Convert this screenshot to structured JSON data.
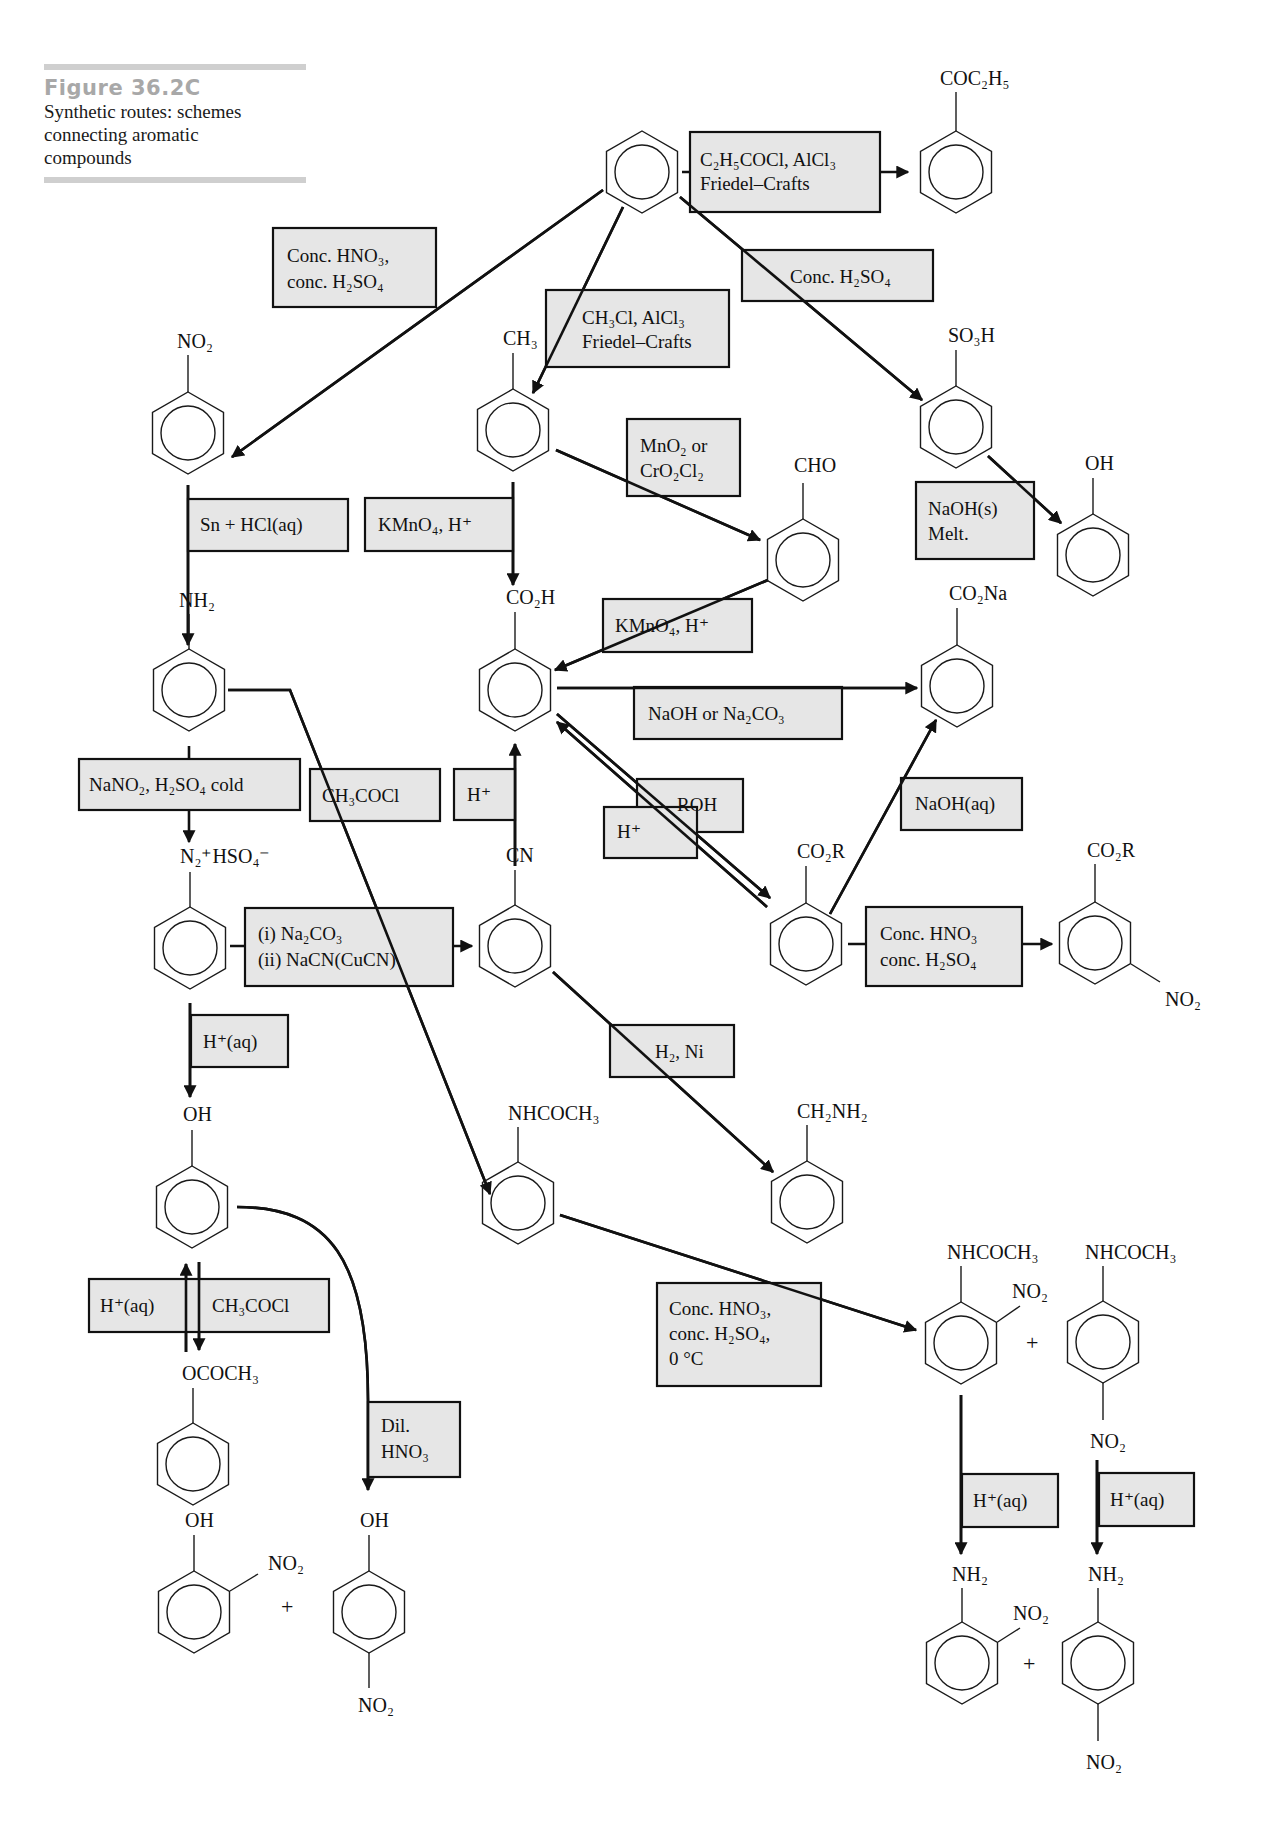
{
  "figure": {
    "number": "Figure 36.2C",
    "caption_lines": [
      "Synthetic routes: schemes",
      "connecting aromatic",
      "compounds"
    ]
  },
  "compounds": {
    "benzene": {
      "label": ""
    },
    "propiophenone": {
      "label": "COC₂H₅"
    },
    "nitrobenzene": {
      "label": "NO₂"
    },
    "toluene": {
      "label": "CH₃"
    },
    "benzenesulfonic_acid": {
      "label": "SO₃H"
    },
    "phenol_from_sulfonate": {
      "label": "OH"
    },
    "benzaldehyde": {
      "label": "CHO"
    },
    "phenylamine": {
      "label": "NH₂"
    },
    "benzoic_acid": {
      "label": "CO₂H"
    },
    "sodium_benzoate": {
      "label": "CO₂Na"
    },
    "diazonium_salt": {
      "label": "N₂⁺HSO₄⁻"
    },
    "benzonitrile": {
      "label": "CN"
    },
    "ester": {
      "label": "CO₂R"
    },
    "nitro_ester": {
      "label_top": "CO₂R",
      "label_meta": "NO₂"
    },
    "phenol": {
      "label": "OH"
    },
    "acetanilide": {
      "label": "NHCOCH₃"
    },
    "benzylamine": {
      "label": "CH₂NH₂"
    },
    "phenyl_ethanoate": {
      "label": "OCOCH₃"
    },
    "o_nitrophenol": {
      "label_top": "OH",
      "label_ortho": "NO₂"
    },
    "p_nitrophenol": {
      "label_top": "OH",
      "label_para": "NO₂"
    },
    "o_nitroacetanilide": {
      "label_top": "NHCOCH₃",
      "label_ortho": "NO₂"
    },
    "p_nitroacetanilide": {
      "label_top": "NHCOCH₃",
      "label_para": "NO₂"
    },
    "o_nitroaniline": {
      "label_top": "NH₂",
      "label_ortho": "NO₂"
    },
    "p_nitroaniline": {
      "label_top": "NH₂",
      "label_para": "NO₂"
    },
    "plus_sign": "+"
  },
  "reagents": {
    "friedel_crafts_acylation": [
      "C₂H₅COCl, AlCl₃",
      "Friedel–Crafts"
    ],
    "nitration": [
      "Conc. HNO₃,",
      "conc. H₂SO₄"
    ],
    "friedel_crafts_alkylation": [
      "CH₃Cl, AlCl₃",
      "Friedel–Crafts"
    ],
    "sulfonation": [
      "Conc. H₂SO₄"
    ],
    "oxidation_to_aldehyde": [
      "MnO₂ or",
      "CrO₂Cl₂"
    ],
    "alkali_fusion": [
      "NaOH(s)",
      "Melt."
    ],
    "reduction": [
      "Sn + HCl(aq)"
    ],
    "toluene_oxidation": [
      "KMnO₄, H⁺"
    ],
    "aldehyde_oxidation": [
      "KMnO₄, H⁺"
    ],
    "neutralisation": [
      "NaOH or Na₂CO₃"
    ],
    "diazotisation": [
      "NaNO₂, H₂SO₄ cold"
    ],
    "acylation_amine": [
      "CH₃COCl"
    ],
    "nitrile_hydrolysis": [
      "H⁺"
    ],
    "esterification_roh": [
      "ROH"
    ],
    "esterification_h": [
      "H⁺"
    ],
    "ester_hydrolysis": [
      "NaOH(aq)"
    ],
    "sandmeyer": [
      "(i) Na₂CO₃",
      "(ii) NaCN(CuCN)"
    ],
    "ester_nitration": [
      "Conc. HNO₃",
      "conc. H₂SO₄"
    ],
    "diazo_hydrolysis": [
      "H⁺(aq)"
    ],
    "nitrile_reduction": [
      "H₂, Ni"
    ],
    "ester_hydrolysis_phenyl": [
      "H⁺(aq)"
    ],
    "phenol_acylation": [
      "CH₃COCl"
    ],
    "phenol_nitration": [
      "Dil.",
      "HNO₃"
    ],
    "acetanilide_nitration": [
      "Conc. HNO₃,",
      "conc. H₂SO₄,",
      "0 °C"
    ],
    "amide_hydrolysis_ortho": [
      "H⁺(aq)"
    ],
    "amide_hydrolysis_para": [
      "H⁺(aq)"
    ]
  },
  "colors": {
    "box_fill": "#e6e6e6",
    "line": "#111111",
    "figure_number": "#a8a8a8",
    "rule": "#cfcfcf"
  }
}
